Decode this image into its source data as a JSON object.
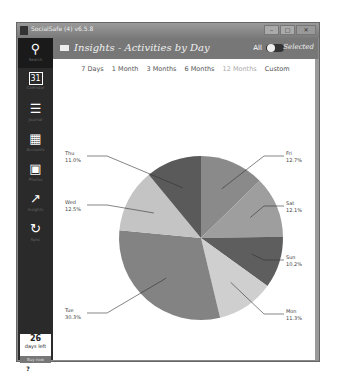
{
  "window": {
    "title": "SocialSafe (4) v6.5.8",
    "buttons": [
      "–",
      "□",
      "✕"
    ]
  },
  "sidebar": {
    "items": [
      {
        "label": "Search",
        "icon": "search-icon",
        "glyph": "⚲"
      },
      {
        "label": "Calendar",
        "icon": "calendar-icon",
        "glyph": "31"
      },
      {
        "label": "Journal",
        "icon": "list-icon",
        "glyph": "☰"
      },
      {
        "label": "Accounts",
        "icon": "grid-icon",
        "glyph": "▦"
      },
      {
        "label": "Photos",
        "icon": "photos-icon",
        "glyph": "▣"
      },
      {
        "label": "Insights",
        "icon": "chart-icon",
        "glyph": "↗"
      },
      {
        "label": "Sync",
        "icon": "sync-icon",
        "glyph": "↻"
      }
    ],
    "trial": {
      "days": "26",
      "days_label": "days left",
      "buy_label": "Buy now"
    },
    "help_glyph": "?",
    "settings_glyph": "⚙"
  },
  "header": {
    "title": "Insights - Activities by Day",
    "toggle_left": "All",
    "toggle_right": "Selected"
  },
  "ranges": [
    {
      "label": "7 Days",
      "active": false
    },
    {
      "label": "1 Month",
      "active": false
    },
    {
      "label": "3 Months",
      "active": false
    },
    {
      "label": "6 Months",
      "active": false
    },
    {
      "label": "12 Months",
      "active": true
    },
    {
      "label": "Custom",
      "active": false
    }
  ],
  "chart_data": {
    "type": "pie",
    "title": "Activities by Day",
    "slices": [
      {
        "label": "Fri",
        "value": 12.7,
        "display": "12.7%",
        "color": "#8a8a8a"
      },
      {
        "label": "Sat",
        "value": 12.1,
        "display": "12.1%",
        "color": "#9e9e9e"
      },
      {
        "label": "Sun",
        "value": 10.2,
        "display": "10.2%",
        "color": "#5e5e5e"
      },
      {
        "label": "Mon",
        "value": 11.3,
        "display": "11.3%",
        "color": "#cfcfcf"
      },
      {
        "label": "Tue",
        "value": 30.3,
        "display": "30.3%",
        "color": "#838383"
      },
      {
        "label": "Wed",
        "value": 12.5,
        "display": "12.5%",
        "color": "#c4c4c4"
      },
      {
        "label": "Thu",
        "value": 11.0,
        "display": "11.0%",
        "color": "#5a5a5a"
      }
    ]
  }
}
